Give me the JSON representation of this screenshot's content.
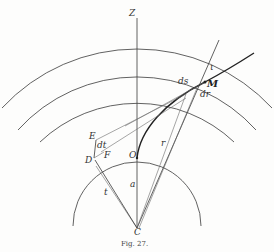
{
  "figure": {
    "caption": "Fig. 27.",
    "labels": {
      "axis": "Z",
      "angle": "ι",
      "ds": "ds",
      "point_m": "M",
      "dr": "dr",
      "point_e": "E",
      "dt": "dt",
      "point_f": "F",
      "point_d": "D",
      "point_o": "O",
      "radius": "r",
      "a": "a",
      "t": "t",
      "center": "C"
    }
  }
}
